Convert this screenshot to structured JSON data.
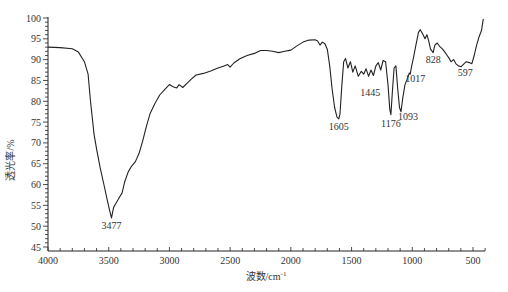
{
  "chart_data": {
    "type": "line",
    "title": "",
    "xlabel": "波数/cm⁻¹",
    "ylabel": "透光率/%",
    "xlim": [
      4000,
      400
    ],
    "ylim": [
      44,
      100
    ],
    "x_reversed": true,
    "grid": false,
    "legend": null,
    "x_ticks": [
      4000,
      3500,
      3000,
      2500,
      2000,
      1500,
      1000,
      500
    ],
    "y_ticks": [
      45,
      50,
      55,
      60,
      65,
      70,
      75,
      80,
      85,
      90,
      95,
      100
    ],
    "series": [
      {
        "name": "IR spectrum",
        "color": "#222222",
        "points": [
          [
            4000,
            93.0
          ],
          [
            3900,
            92.9
          ],
          [
            3800,
            92.6
          ],
          [
            3750,
            91.8
          ],
          [
            3700,
            89.5
          ],
          [
            3670,
            86.5
          ],
          [
            3650,
            80.0
          ],
          [
            3620,
            72.0
          ],
          [
            3600,
            68.5
          ],
          [
            3570,
            64.0
          ],
          [
            3540,
            60.0
          ],
          [
            3510,
            56.0
          ],
          [
            3490,
            53.5
          ],
          [
            3477,
            52.0
          ],
          [
            3460,
            54.5
          ],
          [
            3440,
            55.5
          ],
          [
            3410,
            57.0
          ],
          [
            3390,
            58.0
          ],
          [
            3370,
            60.5
          ],
          [
            3340,
            63.0
          ],
          [
            3310,
            64.5
          ],
          [
            3280,
            65.5
          ],
          [
            3250,
            67.5
          ],
          [
            3220,
            70.5
          ],
          [
            3190,
            74.0
          ],
          [
            3160,
            77.0
          ],
          [
            3120,
            79.5
          ],
          [
            3080,
            81.5
          ],
          [
            3040,
            82.8
          ],
          [
            3000,
            84.0
          ],
          [
            2970,
            83.5
          ],
          [
            2940,
            83.2
          ],
          [
            2920,
            84.0
          ],
          [
            2890,
            83.3
          ],
          [
            2860,
            84.2
          ],
          [
            2820,
            85.3
          ],
          [
            2780,
            86.3
          ],
          [
            2720,
            86.7
          ],
          [
            2660,
            87.3
          ],
          [
            2600,
            88.0
          ],
          [
            2550,
            88.5
          ],
          [
            2520,
            88.8
          ],
          [
            2500,
            88.2
          ],
          [
            2470,
            89.2
          ],
          [
            2420,
            90.2
          ],
          [
            2360,
            91.0
          ],
          [
            2300,
            91.5
          ],
          [
            2250,
            92.2
          ],
          [
            2200,
            92.2
          ],
          [
            2150,
            92.0
          ],
          [
            2100,
            91.7
          ],
          [
            2050,
            92.0
          ],
          [
            2000,
            92.3
          ],
          [
            1950,
            93.3
          ],
          [
            1900,
            94.2
          ],
          [
            1850,
            94.7
          ],
          [
            1800,
            94.8
          ],
          [
            1780,
            94.5
          ],
          [
            1760,
            93.5
          ],
          [
            1740,
            94.2
          ],
          [
            1720,
            93.8
          ],
          [
            1700,
            92.5
          ],
          [
            1680,
            88.5
          ],
          [
            1660,
            83.0
          ],
          [
            1640,
            78.5
          ],
          [
            1620,
            76.2
          ],
          [
            1605,
            75.8
          ],
          [
            1595,
            77.0
          ],
          [
            1580,
            84.0
          ],
          [
            1565,
            89.5
          ],
          [
            1550,
            90.3
          ],
          [
            1530,
            88.0
          ],
          [
            1510,
            89.5
          ],
          [
            1490,
            87.0
          ],
          [
            1470,
            88.5
          ],
          [
            1445,
            86.0
          ],
          [
            1420,
            87.2
          ],
          [
            1400,
            86.5
          ],
          [
            1380,
            87.8
          ],
          [
            1360,
            86.0
          ],
          [
            1340,
            87.5
          ],
          [
            1320,
            86.2
          ],
          [
            1300,
            88.5
          ],
          [
            1280,
            89.3
          ],
          [
            1260,
            87.5
          ],
          [
            1240,
            89.8
          ],
          [
            1220,
            89.5
          ],
          [
            1200,
            84.0
          ],
          [
            1185,
            78.0
          ],
          [
            1176,
            76.8
          ],
          [
            1165,
            82.0
          ],
          [
            1150,
            88.0
          ],
          [
            1135,
            88.5
          ],
          [
            1120,
            83.0
          ],
          [
            1105,
            78.5
          ],
          [
            1093,
            77.5
          ],
          [
            1080,
            80.5
          ],
          [
            1060,
            84.0
          ],
          [
            1040,
            85.5
          ],
          [
            1025,
            86.8
          ],
          [
            1017,
            86.5
          ],
          [
            1005,
            88.5
          ],
          [
            990,
            90.5
          ],
          [
            970,
            93.5
          ],
          [
            950,
            96.5
          ],
          [
            935,
            97.2
          ],
          [
            915,
            96.2
          ],
          [
            895,
            95.0
          ],
          [
            880,
            96.0
          ],
          [
            865,
            94.5
          ],
          [
            850,
            92.5
          ],
          [
            828,
            91.7
          ],
          [
            815,
            93.5
          ],
          [
            795,
            94.0
          ],
          [
            775,
            93.2
          ],
          [
            750,
            92.5
          ],
          [
            720,
            91.3
          ],
          [
            700,
            90.5
          ],
          [
            680,
            89.5
          ],
          [
            660,
            90.0
          ],
          [
            640,
            89.0
          ],
          [
            620,
            88.5
          ],
          [
            597,
            88.3
          ],
          [
            575,
            89.0
          ],
          [
            555,
            89.5
          ],
          [
            530,
            89.3
          ],
          [
            510,
            89.0
          ],
          [
            490,
            91.0
          ],
          [
            470,
            93.5
          ],
          [
            450,
            95.5
          ],
          [
            430,
            97.0
          ],
          [
            415,
            99.8
          ]
        ]
      }
    ],
    "annotations": [
      {
        "text": "3477",
        "x": 3477,
        "y": 52.0
      },
      {
        "text": "1605",
        "x": 1605,
        "y": 75.8
      },
      {
        "text": "1445",
        "x": 1445,
        "y": 86.0
      },
      {
        "text": "1176",
        "x": 1176,
        "y": 76.8
      },
      {
        "text": "1093",
        "x": 1093,
        "y": 77.5
      },
      {
        "text": "1017",
        "x": 1017,
        "y": 86.5
      },
      {
        "text": "828",
        "x": 828,
        "y": 91.7
      },
      {
        "text": "597",
        "x": 597,
        "y": 88.3
      }
    ]
  },
  "layout": {
    "plot_left": 48,
    "plot_right": 485,
    "plot_top": 18,
    "plot_bottom": 251,
    "y_top_value": 100,
    "y_bottom_value": 44.15
  },
  "labels": {
    "xlabel": "波数/cm",
    "xlabel_sup": "-1",
    "ylabel": "透光率/%"
  }
}
